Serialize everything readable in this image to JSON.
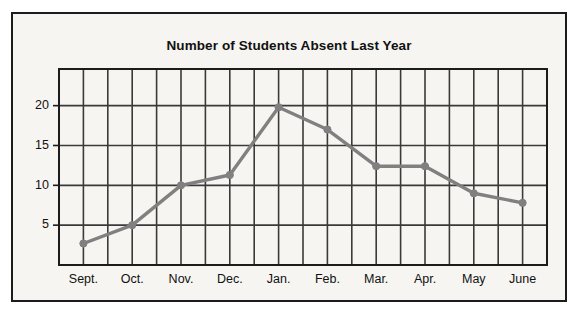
{
  "chart_data": {
    "type": "line",
    "title": "Number of Students Absent Last Year",
    "xlabel": "",
    "ylabel": "",
    "categories": [
      "Sept.",
      "Oct.",
      "Nov.",
      "Dec.",
      "Jan.",
      "Feb.",
      "Mar.",
      "Apr.",
      "May",
      "June"
    ],
    "values": [
      2.7,
      5,
      10,
      11.3,
      19.8,
      17,
      12.4,
      12.4,
      9,
      7.8
    ],
    "series": [
      {
        "name": "Students Absent",
        "values": [
          2.7,
          5,
          10,
          11.3,
          19.8,
          17,
          12.4,
          12.4,
          9,
          7.8
        ]
      }
    ],
    "y_ticks": [
      5,
      10,
      15,
      20
    ],
    "y_tick_labels": [
      "5",
      "10",
      "15",
      "20"
    ],
    "ylim": [
      0,
      24.6
    ],
    "xlim": [
      0,
      20
    ],
    "grid": true,
    "grid_columns": 20,
    "grid_rows": 5,
    "legend": false,
    "legend_position": "none",
    "line_color": "#808080",
    "marker": "circle",
    "marker_color": "#808080",
    "grid_color": "#3a3a3a",
    "axis_color": "#1c1c1c",
    "background_color": "#f6f5f1",
    "border_color": "#1c1c1c",
    "title_color": "#111111"
  }
}
